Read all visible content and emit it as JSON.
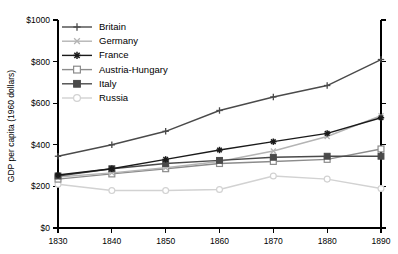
{
  "chart_data": {
    "type": "line",
    "title": "",
    "xlabel": "",
    "ylabel": "GDP per capita (1960 dollars)",
    "x": [
      1830,
      1840,
      1850,
      1860,
      1870,
      1880,
      1890
    ],
    "xtick_labels": [
      "1830",
      "1840",
      "1850",
      "1860",
      "1870",
      "1880",
      "1890"
    ],
    "ytick_labels": [
      "$0",
      "$200",
      "$400",
      "$600",
      "$800",
      "$1000"
    ],
    "ytick_values": [
      0,
      200,
      400,
      600,
      800,
      1000
    ],
    "ylim": [
      0,
      1000
    ],
    "xlim": [
      1830,
      1890
    ],
    "grid": false,
    "legend_position": "top-left-inside",
    "series": [
      {
        "name": "Britain",
        "marker": "plus",
        "color": "#4a4a4a",
        "values": [
          345,
          400,
          465,
          565,
          630,
          685,
          810
        ]
      },
      {
        "name": "Germany",
        "marker": "x",
        "color": "#b4b4b4",
        "values": [
          245,
          265,
          290,
          320,
          370,
          440,
          540
        ]
      },
      {
        "name": "France",
        "marker": "star",
        "color": "#1a1a1a",
        "values": [
          255,
          285,
          330,
          375,
          415,
          455,
          530
        ]
      },
      {
        "name": "Austria-Hungary",
        "marker": "open-square",
        "color": "#8c8c8c",
        "values": [
          235,
          260,
          285,
          310,
          320,
          330,
          380
        ]
      },
      {
        "name": "Italy",
        "marker": "filled-square",
        "color": "#4a4a4a",
        "values": [
          250,
          285,
          310,
          325,
          340,
          345,
          345
        ]
      },
      {
        "name": "Russia",
        "marker": "open-circle",
        "color": "#d2d2d2",
        "values": [
          210,
          180,
          180,
          185,
          250,
          235,
          190
        ]
      }
    ]
  },
  "legend": {
    "items": [
      {
        "label": "Britain"
      },
      {
        "label": "Germany"
      },
      {
        "label": "France"
      },
      {
        "label": "Austria-Hungary"
      },
      {
        "label": "Italy"
      },
      {
        "label": "Russia"
      }
    ]
  },
  "axes": {
    "y_title": "GDP per capita (1960 dollars)"
  }
}
